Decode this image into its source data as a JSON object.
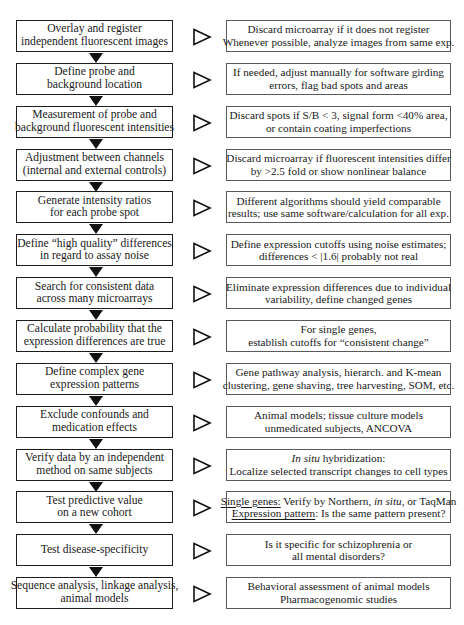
{
  "diagram": {
    "type": "flowchart",
    "colors": {
      "step_border": "#1c1c1c",
      "note_border": "#5a5a5a",
      "arrow": "#111111",
      "background": "#ffffff"
    },
    "steps": [
      {
        "label_lines": [
          "Overlay and register",
          "independent fluorescent images"
        ],
        "note_lines": [
          "Discard microarray if it does not register",
          "Whenever possible, analyze images from same exp."
        ]
      },
      {
        "label_lines": [
          "Define probe and",
          "background location"
        ],
        "note_lines": [
          "If needed, adjust manually for software girding",
          "errors, flag bad spots and areas"
        ]
      },
      {
        "label_lines": [
          "Measurement of probe and",
          "background fluorescent intensities"
        ],
        "note_lines": [
          "Discard spots if S/B < 3, signal form <40% area,",
          "or contain coating imperfections"
        ]
      },
      {
        "label_lines": [
          "Adjustment between channels",
          "(internal and external controls)"
        ],
        "note_lines": [
          "Discard microarray if fluorescent intensities differ",
          "by >2.5 fold or show nonlinear balance"
        ]
      },
      {
        "label_lines": [
          "Generate intensity ratios",
          "for each probe spot"
        ],
        "note_lines": [
          "Different algorithms should yield comparable",
          "results; use same software/calculation for all exp."
        ]
      },
      {
        "label_lines": [
          "Define “high quality” differences",
          "in regard to assay noise"
        ],
        "note_lines": [
          "Define expression cutoffs using noise estimates;",
          "differences < |1.6| probably not real"
        ]
      },
      {
        "label_lines": [
          "Search for consistent data",
          "across many microarrays"
        ],
        "note_lines": [
          "Eliminate expression differences due to individual",
          "variability, define changed genes"
        ]
      },
      {
        "label_lines": [
          "Calculate probability that the",
          "expression differences are true"
        ],
        "note_lines": [
          "For single genes,",
          "establish cutoffs for “consistent change”"
        ]
      },
      {
        "label_lines": [
          "Define complex gene",
          "expression patterns"
        ],
        "note_lines": [
          "Gene pathway analysis, hierarch. and K-mean",
          "clustering, gene shaving, tree harvesting, SOM, etc."
        ]
      },
      {
        "label_lines": [
          "Exclude confounds and",
          "medication effects"
        ],
        "note_lines": [
          "Animal models; tissue culture models",
          "unmedicated subjects, ANCOVA"
        ]
      },
      {
        "label_lines": [
          "Verify data by an independent",
          "method on same subjects"
        ],
        "note_italic_prefix": "In situ",
        "note_line1_rest": " hybridization:",
        "note_line2": "Localize selected transcript changes to cell types"
      },
      {
        "label_lines": [
          "Test predictive value",
          "on a new cohort"
        ],
        "note_l1_u": "Single genes:",
        "note_l1_a": " Verify by Northern, ",
        "note_l1_i": "in situ,",
        "note_l1_b": " or TaqMan",
        "note_l2_u": "Expression pattern",
        "note_l2_rest": ": Is the same pattern present?"
      },
      {
        "label_lines": [
          "Test disease-specificity"
        ],
        "note_lines": [
          "Is it specific for schizophrenia or",
          "all mental disorders?"
        ]
      },
      {
        "label_lines": [
          "Sequence analysis, linkage analysis,",
          "animal models"
        ],
        "note_lines": [
          "Behavioral assessment of animal models",
          "Pharmacogenomic studies"
        ]
      }
    ],
    "icons": {
      "step_connector": "down-triangle-filled",
      "note_connector": "right-triangle-hollow"
    }
  }
}
